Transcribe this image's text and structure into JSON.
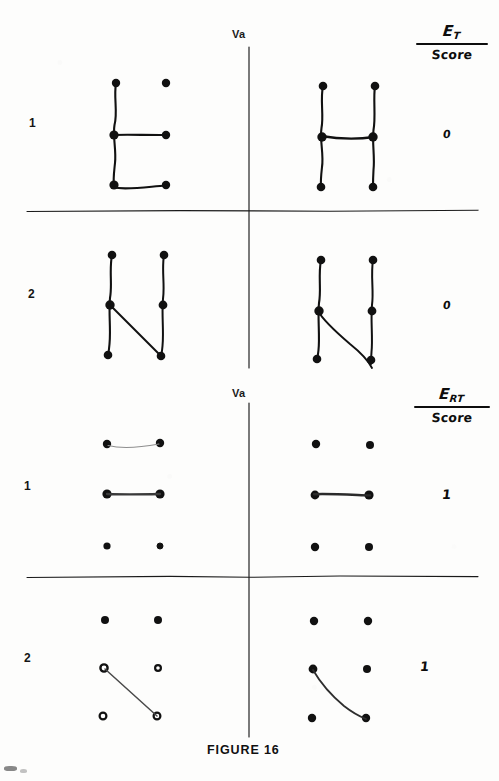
{
  "figure": {
    "caption": "FIGURE 16",
    "background_color": "#fdfdfc",
    "ink_color": "#111111",
    "width": 499,
    "height": 781
  },
  "sections": [
    {
      "id": "et",
      "header": {
        "numerator_main": "E",
        "numerator_subscript": "T",
        "denominator": "Score"
      },
      "axis_label": "Va",
      "rows": [
        {
          "label": "1",
          "score": "0",
          "left_panel": {
            "name": "letter-e-dot-figure",
            "dots": 6,
            "strokes": [
              "left-vertical",
              "middle-horizontal",
              "bottom-horizontal"
            ]
          },
          "right_panel": {
            "name": "letter-h-dot-figure",
            "dots": 6,
            "strokes": [
              "left-vertical",
              "right-vertical",
              "middle-horizontal"
            ]
          }
        },
        {
          "label": "2",
          "score": "0",
          "left_panel": {
            "name": "letter-n-dot-figure",
            "dots": 6,
            "strokes": [
              "left-vertical",
              "right-vertical",
              "diagonal"
            ]
          },
          "right_panel": {
            "name": "letter-n-dot-figure-overshoot",
            "dots": 6,
            "strokes": [
              "left-vertical",
              "right-vertical",
              "diagonal-overshoot"
            ]
          }
        }
      ]
    },
    {
      "id": "ert",
      "header": {
        "numerator_main": "E",
        "numerator_subscript": "RT",
        "denominator": "Score"
      },
      "axis_label": "Va",
      "rows": [
        {
          "label": "1",
          "score": "1",
          "left_panel": {
            "name": "two-horizontal-dot-figure",
            "dots": 6,
            "strokes": [
              "top-horizontal-faint",
              "middle-horizontal"
            ]
          },
          "right_panel": {
            "name": "single-horizontal-dot-figure",
            "dots": 6,
            "strokes": [
              "middle-horizontal"
            ]
          }
        },
        {
          "label": "2",
          "score": "1",
          "left_panel": {
            "name": "diagonal-dot-figure-open-dots",
            "dots": 6,
            "strokes": [
              "diagonal-straight"
            ]
          },
          "right_panel": {
            "name": "diagonal-dot-figure-curved",
            "dots": 6,
            "strokes": [
              "diagonal-curved"
            ]
          }
        }
      ]
    }
  ]
}
